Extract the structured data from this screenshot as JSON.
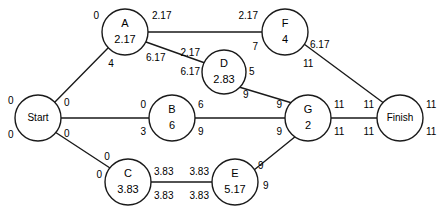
{
  "diagram": {
    "type": "activity-on-node-network",
    "stroke_color": "#1a1a1a",
    "fill_color": "#ffffff",
    "text_color": "#000000",
    "nodes": [
      {
        "id": "start",
        "label": "Start",
        "duration": "",
        "cx": 38,
        "cy": 118,
        "r": 23
      },
      {
        "id": "A",
        "label": "A",
        "duration": "2.17",
        "cx": 125,
        "cy": 32,
        "r": 23
      },
      {
        "id": "B",
        "label": "B",
        "duration": "6",
        "cx": 172,
        "cy": 118,
        "r": 23
      },
      {
        "id": "C",
        "label": "C",
        "duration": "3.83",
        "cx": 128,
        "cy": 182,
        "r": 23
      },
      {
        "id": "D",
        "label": "D",
        "duration": "2.83",
        "cx": 224,
        "cy": 72,
        "r": 22
      },
      {
        "id": "E",
        "label": "E",
        "duration": "5.17",
        "cx": 235,
        "cy": 182,
        "r": 23
      },
      {
        "id": "F",
        "label": "F",
        "duration": "4",
        "cx": 285,
        "cy": 32,
        "r": 23
      },
      {
        "id": "G",
        "label": "G",
        "duration": "2",
        "cx": 308,
        "cy": 118,
        "r": 23
      },
      {
        "id": "finish",
        "label": "Finish",
        "duration": "",
        "cx": 400,
        "cy": 118,
        "r": 23
      }
    ],
    "edges": [
      {
        "id": "start-A",
        "from": "start",
        "to": "A",
        "x1": 54,
        "y1": 103,
        "x2": 108,
        "y2": 48
      },
      {
        "id": "start-B",
        "from": "start",
        "to": "B",
        "x1": 61,
        "y1": 118,
        "x2": 149,
        "y2": 118
      },
      {
        "id": "start-C",
        "from": "start",
        "to": "C",
        "x1": 55,
        "y1": 132,
        "x2": 110,
        "y2": 168
      },
      {
        "id": "A-F",
        "from": "A",
        "to": "F",
        "x1": 148,
        "y1": 32,
        "x2": 262,
        "y2": 32
      },
      {
        "id": "A-D",
        "from": "A",
        "to": "D",
        "x1": 146,
        "y1": 42,
        "x2": 205,
        "y2": 63
      },
      {
        "id": "D-G",
        "from": "D",
        "to": "G",
        "x1": 239,
        "y1": 87,
        "x2": 292,
        "y2": 103
      },
      {
        "id": "B-G",
        "from": "B",
        "to": "G",
        "x1": 195,
        "y1": 118,
        "x2": 285,
        "y2": 118
      },
      {
        "id": "C-E",
        "from": "C",
        "to": "E",
        "x1": 151,
        "y1": 182,
        "x2": 212,
        "y2": 182
      },
      {
        "id": "E-G",
        "from": "E",
        "to": "G",
        "x1": 254,
        "y1": 170,
        "x2": 296,
        "y2": 136
      },
      {
        "id": "F-finish",
        "from": "F",
        "to": "finish",
        "x1": 304,
        "y1": 44,
        "x2": 385,
        "y2": 104
      },
      {
        "id": "G-finish",
        "from": "G",
        "to": "finish",
        "x1": 331,
        "y1": 118,
        "x2": 377,
        "y2": 118
      }
    ],
    "labels": [
      {
        "id": "start-es",
        "node": "start",
        "corner": "top-left",
        "text": "0",
        "x": 8,
        "y": 101,
        "anchor": "start"
      },
      {
        "id": "start-ls",
        "node": "start",
        "corner": "bottom-left",
        "text": "0",
        "x": 8,
        "y": 135,
        "anchor": "start"
      },
      {
        "id": "start-ef-a",
        "node": "start",
        "corner": "top-right",
        "text": "0",
        "x": 64,
        "y": 103,
        "anchor": "start"
      },
      {
        "id": "start-ef-b",
        "node": "start",
        "corner": "bottom-right",
        "text": "0",
        "x": 64,
        "y": 134,
        "anchor": "start"
      },
      {
        "id": "A-es",
        "node": "A",
        "corner": "top-left",
        "text": "0",
        "x": 99,
        "y": 16,
        "anchor": "end"
      },
      {
        "id": "A-ef",
        "node": "A",
        "corner": "top-right",
        "text": "2.17",
        "x": 152,
        "y": 16,
        "anchor": "start"
      },
      {
        "id": "A-ls",
        "node": "A",
        "corner": "bottom-left",
        "text": "4",
        "x": 111,
        "y": 64,
        "anchor": "middle"
      },
      {
        "id": "A-lf",
        "node": "A",
        "corner": "bottom-right",
        "text": "6.17",
        "x": 146,
        "y": 58,
        "anchor": "start"
      },
      {
        "id": "B-es",
        "node": "B",
        "corner": "top-left",
        "text": "0",
        "x": 146,
        "y": 105,
        "anchor": "end"
      },
      {
        "id": "B-ef",
        "node": "B",
        "corner": "top-right",
        "text": "6",
        "x": 198,
        "y": 105,
        "anchor": "start"
      },
      {
        "id": "B-ls",
        "node": "B",
        "corner": "bottom-left",
        "text": "3",
        "x": 146,
        "y": 132,
        "anchor": "end"
      },
      {
        "id": "B-lf",
        "node": "B",
        "corner": "bottom-right",
        "text": "9",
        "x": 198,
        "y": 132,
        "anchor": "start"
      },
      {
        "id": "C-es-up",
        "node": "C",
        "corner": "top-left-up",
        "text": "0",
        "x": 107,
        "y": 157,
        "anchor": "middle"
      },
      {
        "id": "C-ls",
        "node": "C",
        "corner": "left",
        "text": "0",
        "x": 102,
        "y": 175,
        "anchor": "end"
      },
      {
        "id": "C-ef",
        "node": "C",
        "corner": "top-right",
        "text": "3.83",
        "x": 154,
        "y": 172,
        "anchor": "start"
      },
      {
        "id": "C-lf",
        "node": "C",
        "corner": "bottom-right",
        "text": "3.83",
        "x": 154,
        "y": 196,
        "anchor": "start"
      },
      {
        "id": "D-es",
        "node": "D",
        "corner": "top-left",
        "text": "2.17",
        "x": 200,
        "y": 53,
        "anchor": "end"
      },
      {
        "id": "D-ls",
        "node": "D",
        "corner": "bottom-left",
        "text": "6.17",
        "x": 200,
        "y": 72,
        "anchor": "end"
      },
      {
        "id": "D-ef",
        "node": "D",
        "corner": "top-right",
        "text": "5",
        "x": 249,
        "y": 72,
        "anchor": "start"
      },
      {
        "id": "D-lf",
        "node": "D",
        "corner": "bottom-right",
        "text": "9",
        "x": 243,
        "y": 95,
        "anchor": "start"
      },
      {
        "id": "E-es",
        "node": "E",
        "corner": "top-left",
        "text": "3.83",
        "x": 209,
        "y": 172,
        "anchor": "end"
      },
      {
        "id": "E-ls",
        "node": "E",
        "corner": "bottom-left",
        "text": "3.83",
        "x": 209,
        "y": 196,
        "anchor": "end"
      },
      {
        "id": "E-ef",
        "node": "E",
        "corner": "top-right",
        "text": "9",
        "x": 258,
        "y": 166,
        "anchor": "start"
      },
      {
        "id": "E-lf",
        "node": "E",
        "corner": "bottom-right",
        "text": "9",
        "x": 263,
        "y": 186,
        "anchor": "start"
      },
      {
        "id": "F-es",
        "node": "F",
        "corner": "top-left",
        "text": "2.17",
        "x": 258,
        "y": 16,
        "anchor": "end"
      },
      {
        "id": "F-ls",
        "node": "F",
        "corner": "bottom-left",
        "text": "7",
        "x": 258,
        "y": 47,
        "anchor": "end"
      },
      {
        "id": "F-ef",
        "node": "F",
        "corner": "top-right",
        "text": "6.17",
        "x": 310,
        "y": 45,
        "anchor": "start"
      },
      {
        "id": "F-lf",
        "node": "F",
        "corner": "bottom-right",
        "text": "11",
        "x": 303,
        "y": 64,
        "anchor": "start"
      },
      {
        "id": "G-es",
        "node": "G",
        "corner": "top-left",
        "text": "9",
        "x": 282,
        "y": 105,
        "anchor": "end"
      },
      {
        "id": "G-ls",
        "node": "G",
        "corner": "bottom-left",
        "text": "9",
        "x": 282,
        "y": 132,
        "anchor": "end"
      },
      {
        "id": "G-ef",
        "node": "G",
        "corner": "top-right",
        "text": "11",
        "x": 334,
        "y": 105,
        "anchor": "start"
      },
      {
        "id": "G-lf",
        "node": "G",
        "corner": "bottom-right",
        "text": "11",
        "x": 334,
        "y": 132,
        "anchor": "start"
      },
      {
        "id": "finish-es",
        "node": "finish",
        "corner": "top-left",
        "text": "11",
        "x": 374,
        "y": 105,
        "anchor": "end"
      },
      {
        "id": "finish-ls",
        "node": "finish",
        "corner": "bottom-left",
        "text": "11",
        "x": 374,
        "y": 132,
        "anchor": "end"
      },
      {
        "id": "finish-ef",
        "node": "finish",
        "corner": "top-right",
        "text": "11",
        "x": 426,
        "y": 105,
        "anchor": "start"
      },
      {
        "id": "finish-lf",
        "node": "finish",
        "corner": "bottom-right",
        "text": "11",
        "x": 426,
        "y": 132,
        "anchor": "start"
      }
    ]
  }
}
